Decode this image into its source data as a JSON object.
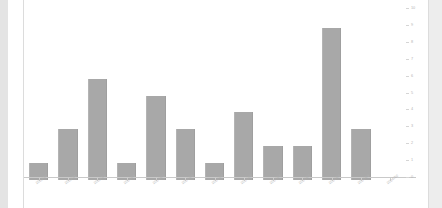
{
  "chart_data": {
    "type": "bar",
    "title": "",
    "subtitle": "",
    "xlabel": "",
    "ylabel": "",
    "ylim": [
      0,
      10
    ],
    "grid": false,
    "legend": false,
    "legend_position": "none",
    "y_axis_side": "right",
    "bar_color": "#a8a8a8",
    "categories": [
      "2023/10",
      "2023/11",
      "2023/12",
      "2024/01",
      "2024/02",
      "2024/03",
      "2024/04",
      "2024/05",
      "2024/06",
      "2024/07",
      "2024/08",
      "2024/09",
      "2024/10"
    ],
    "values": [
      1,
      3,
      6,
      1,
      5,
      3,
      1,
      4,
      2,
      2,
      9,
      3,
      0
    ],
    "y_ticks": [
      "0",
      "1",
      "2",
      "3",
      "4",
      "5",
      "6",
      "7",
      "8",
      "9",
      "10"
    ]
  },
  "canvas": {
    "background_color": "#ffffff",
    "edge_strip_color": "#e4e4e4",
    "axis_color": "#c9c9c9"
  }
}
